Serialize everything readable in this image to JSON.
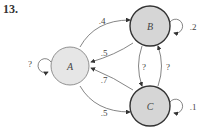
{
  "problem_number": "13.",
  "diagram": {
    "type": "markov-chain",
    "states": [
      {
        "id": "A",
        "label": "A",
        "self_loop": "?"
      },
      {
        "id": "B",
        "label": "B",
        "self_loop": ".2"
      },
      {
        "id": "C",
        "label": "C",
        "self_loop": ".1"
      }
    ],
    "transitions": [
      {
        "from": "A",
        "to": "B",
        "label": ".4"
      },
      {
        "from": "B",
        "to": "A",
        "label": ".5"
      },
      {
        "from": "C",
        "to": "A",
        "label": ".7"
      },
      {
        "from": "A",
        "to": "C",
        "label": ".5"
      },
      {
        "from": "B",
        "to": "C",
        "label": "?"
      },
      {
        "from": "C",
        "to": "B",
        "label": "?"
      }
    ],
    "colors": {
      "node_fill": "#e0e0e0",
      "node_fill_dark": "#d4d4d4",
      "stroke": "#333333",
      "edge": "#555555"
    }
  }
}
